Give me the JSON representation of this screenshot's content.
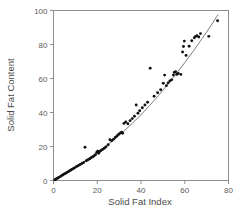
{
  "chart_data": {
    "type": "scatter",
    "title": "",
    "xlabel": "Solid Fat Index",
    "ylabel": "Solid Fat Content",
    "xlim": [
      0,
      80
    ],
    "ylim": [
      0,
      100
    ],
    "xticks": [
      0,
      20,
      40,
      60,
      80
    ],
    "yticks": [
      0,
      20,
      40,
      60,
      80,
      100
    ],
    "xtick_labels": [
      "0",
      "20",
      "40",
      "60",
      "80"
    ],
    "ytick_labels": [
      "0",
      "20",
      "40",
      "60",
      "80",
      "100"
    ],
    "grid": false,
    "legend": null,
    "legend_position": "none",
    "marker": "filled-circle",
    "marker_color": "#111111",
    "curve_color": "#6e6e6e",
    "frame_color": "#8d8d8d",
    "annotations": [],
    "series": [
      {
        "name": "Solid Fat Content vs Solid Fat Index",
        "points": [
          [
            0.6,
            0.4
          ],
          [
            1.2,
            0.9
          ],
          [
            1.8,
            1.3
          ],
          [
            2.4,
            1.8
          ],
          [
            3.2,
            2.4
          ],
          [
            3.8,
            2.9
          ],
          [
            4.4,
            3.4
          ],
          [
            5.0,
            3.9
          ],
          [
            5.6,
            4.3
          ],
          [
            6.2,
            4.8
          ],
          [
            6.8,
            5.2
          ],
          [
            7.4,
            5.8
          ],
          [
            8.0,
            6.2
          ],
          [
            8.6,
            6.7
          ],
          [
            9.2,
            7.1
          ],
          [
            9.8,
            7.6
          ],
          [
            10.6,
            8.2
          ],
          [
            11.4,
            8.8
          ],
          [
            12.2,
            9.4
          ],
          [
            13.0,
            10.0
          ],
          [
            13.8,
            10.6
          ],
          [
            14.4,
            19.6
          ],
          [
            15.0,
            11.6
          ],
          [
            15.8,
            12.2
          ],
          [
            16.6,
            12.8
          ],
          [
            17.2,
            13.4
          ],
          [
            18.0,
            14.0
          ],
          [
            18.6,
            14.5
          ],
          [
            19.2,
            15.2
          ],
          [
            19.8,
            16.6
          ],
          [
            20.2,
            17.2
          ],
          [
            20.6,
            16.0
          ],
          [
            21.0,
            16.9
          ],
          [
            21.6,
            17.5
          ],
          [
            22.4,
            18.2
          ],
          [
            23.2,
            19.0
          ],
          [
            24.0,
            19.8
          ],
          [
            25.0,
            21.0
          ],
          [
            25.8,
            24.0
          ],
          [
            26.6,
            23.4
          ],
          [
            27.4,
            24.2
          ],
          [
            28.2,
            25.3
          ],
          [
            29.0,
            26.2
          ],
          [
            29.8,
            27.2
          ],
          [
            30.6,
            28.0
          ],
          [
            31.2,
            28.4
          ],
          [
            31.6,
            27.8
          ],
          [
            32.2,
            33.6
          ],
          [
            33.0,
            34.4
          ],
          [
            34.0,
            33.4
          ],
          [
            35.0,
            35.2
          ],
          [
            36.0,
            36.4
          ],
          [
            37.0,
            37.8
          ],
          [
            37.8,
            44.4
          ],
          [
            38.6,
            39.6
          ],
          [
            39.4,
            41.0
          ],
          [
            40.6,
            42.8
          ],
          [
            41.8,
            44.4
          ],
          [
            43.0,
            46.0
          ],
          [
            44.2,
            66.0
          ],
          [
            46.0,
            49.6
          ],
          [
            47.6,
            51.6
          ],
          [
            49.0,
            53.4
          ],
          [
            50.2,
            57.2
          ],
          [
            50.8,
            62.0
          ],
          [
            51.6,
            55.8
          ],
          [
            52.4,
            57.4
          ],
          [
            53.2,
            58.6
          ],
          [
            54.0,
            59.2
          ],
          [
            54.8,
            62.0
          ],
          [
            55.2,
            63.6
          ],
          [
            55.8,
            64.0
          ],
          [
            56.4,
            62.4
          ],
          [
            57.0,
            63.0
          ],
          [
            58.2,
            62.4
          ],
          [
            59.0,
            75.6
          ],
          [
            59.4,
            78.8
          ],
          [
            59.8,
            82.0
          ],
          [
            60.6,
            73.6
          ],
          [
            62.0,
            79.0
          ],
          [
            63.2,
            82.2
          ],
          [
            64.4,
            84.0
          ],
          [
            65.0,
            84.8
          ],
          [
            65.6,
            85.2
          ],
          [
            66.4,
            84.4
          ],
          [
            67.2,
            86.4
          ],
          [
            71.0,
            84.8
          ],
          [
            75.0,
            94.0
          ]
        ]
      }
    ],
    "fit_curve": {
      "name": "fitted-curve",
      "points": [
        [
          0.0,
          0.0
        ],
        [
          4.0,
          2.9
        ],
        [
          8.0,
          6.1
        ],
        [
          12.0,
          9.4
        ],
        [
          16.0,
          12.9
        ],
        [
          20.0,
          16.5
        ],
        [
          24.0,
          20.3
        ],
        [
          28.0,
          24.4
        ],
        [
          32.0,
          28.8
        ],
        [
          36.0,
          33.6
        ],
        [
          40.0,
          38.7
        ],
        [
          44.0,
          44.2
        ],
        [
          48.0,
          50.0
        ],
        [
          52.0,
          56.2
        ],
        [
          56.0,
          62.6
        ],
        [
          60.0,
          69.3
        ],
        [
          64.0,
          76.3
        ],
        [
          68.0,
          83.6
        ],
        [
          72.0,
          91.2
        ],
        [
          75.2,
          97.6
        ]
      ]
    }
  }
}
